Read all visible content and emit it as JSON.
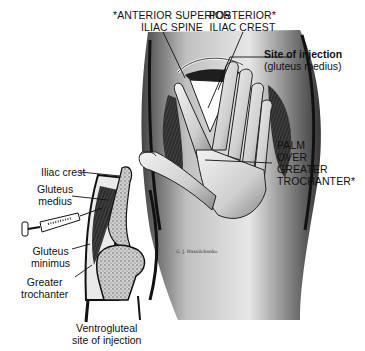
{
  "figure": {
    "type": "anatomical-illustration"
  },
  "labels": {
    "anterior_superior_iliac_spine": [
      "*ANTERIOR SUPERIOR",
      "ILIAC SPINE"
    ],
    "posterior_iliac_crest": [
      "POSTERIOR*",
      "ILIAC CREST"
    ],
    "site_of_injection_title": "Site of injection",
    "site_of_injection_sub": "(gluteus medius)",
    "palm_over_trochanter": [
      "PALM",
      "OVER",
      "GREATER",
      "TROCHANTER*"
    ],
    "iliac_crest": "Iliac crest",
    "gluteus_medius": [
      "Gluteus",
      "medius"
    ],
    "gluteus_minimus": [
      "Gluteus",
      "minimus"
    ],
    "greater_trochanter": [
      "Greater",
      "trochanter"
    ],
    "caption": [
      "Ventrogluteal",
      "site of injection"
    ],
    "artist_signature": "G. J. Wassilchenko"
  },
  "colors": {
    "ink": "#111111",
    "shade_dark": "#2a2a2a",
    "shade_mid": "#7a7a7a",
    "shade_light": "#cfcfcf",
    "bone": "#bdbdbd",
    "background": "#ffffff"
  }
}
